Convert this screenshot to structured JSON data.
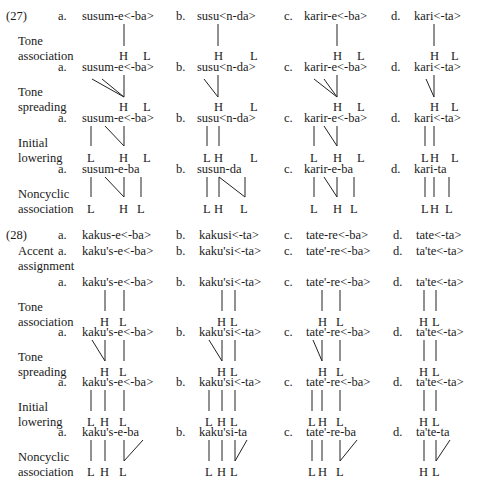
{
  "texts": [
    {
      "id": "ex27",
      "x": 6,
      "y": 9,
      "s": "(27)"
    },
    {
      "id": "r1a",
      "x": 58,
      "y": 9,
      "s": "a."
    },
    {
      "id": "r1aw",
      "x": 82,
      "y": 9,
      "s": "susum-e<-ba>"
    },
    {
      "id": "r1b",
      "x": 176,
      "y": 9,
      "s": "b."
    },
    {
      "id": "r1bw",
      "x": 197,
      "y": 9,
      "s": "susu<n-da>"
    },
    {
      "id": "r1c",
      "x": 284,
      "y": 9,
      "s": "c."
    },
    {
      "id": "r1cw",
      "x": 304,
      "y": 9,
      "s": "karir-e<-ba>"
    },
    {
      "id": "r1d",
      "x": 391,
      "y": 9,
      "s": "d."
    },
    {
      "id": "r1dw",
      "x": 414,
      "y": 9,
      "s": "kari<-ta>"
    },
    {
      "id": "l1a",
      "x": 18,
      "y": 34,
      "s": "Tone"
    },
    {
      "id": "l1b",
      "x": 18,
      "y": 49,
      "s": "association"
    },
    {
      "id": "t1a1",
      "x": 119,
      "y": 49,
      "s": "H"
    },
    {
      "id": "t1a2",
      "x": 143,
      "y": 49,
      "s": "L"
    },
    {
      "id": "t1b1",
      "x": 214,
      "y": 49,
      "s": "H"
    },
    {
      "id": "t1b2",
      "x": 250,
      "y": 49,
      "s": "L"
    },
    {
      "id": "t1c1",
      "x": 333,
      "y": 49,
      "s": "H"
    },
    {
      "id": "t1c2",
      "x": 357,
      "y": 49,
      "s": "L"
    },
    {
      "id": "t1d1",
      "x": 430,
      "y": 49,
      "s": "H"
    },
    {
      "id": "t1d2",
      "x": 451,
      "y": 49,
      "s": "L"
    },
    {
      "id": "r2a",
      "x": 58,
      "y": 60,
      "s": "a."
    },
    {
      "id": "r2aw",
      "x": 82,
      "y": 60,
      "s": "susum-e<-ba>"
    },
    {
      "id": "r2b",
      "x": 176,
      "y": 60,
      "s": "b."
    },
    {
      "id": "r2bw",
      "x": 197,
      "y": 60,
      "s": "susu<n-da>"
    },
    {
      "id": "r2c",
      "x": 284,
      "y": 60,
      "s": "c."
    },
    {
      "id": "r2cw",
      "x": 304,
      "y": 60,
      "s": "karir-e<-ba>"
    },
    {
      "id": "r2d",
      "x": 391,
      "y": 60,
      "s": "d."
    },
    {
      "id": "r2dw",
      "x": 414,
      "y": 60,
      "s": "kari<-ta>"
    },
    {
      "id": "l2a",
      "x": 18,
      "y": 85,
      "s": "Tone"
    },
    {
      "id": "l2b",
      "x": 18,
      "y": 100,
      "s": "spreading"
    },
    {
      "id": "t2a1",
      "x": 119,
      "y": 100,
      "s": "H"
    },
    {
      "id": "t2a2",
      "x": 143,
      "y": 100,
      "s": "L"
    },
    {
      "id": "t2b1",
      "x": 214,
      "y": 100,
      "s": "H"
    },
    {
      "id": "t2b2",
      "x": 250,
      "y": 100,
      "s": "L"
    },
    {
      "id": "t2c1",
      "x": 333,
      "y": 100,
      "s": "H"
    },
    {
      "id": "t2c2",
      "x": 357,
      "y": 100,
      "s": "L"
    },
    {
      "id": "t2d1",
      "x": 430,
      "y": 100,
      "s": "H"
    },
    {
      "id": "t2d2",
      "x": 451,
      "y": 100,
      "s": "L"
    },
    {
      "id": "r3a",
      "x": 58,
      "y": 111,
      "s": "a."
    },
    {
      "id": "r3aw",
      "x": 82,
      "y": 111,
      "s": "susum-e<-ba>"
    },
    {
      "id": "r3b",
      "x": 176,
      "y": 111,
      "s": "b."
    },
    {
      "id": "r3bw",
      "x": 197,
      "y": 111,
      "s": "susu<n-da>"
    },
    {
      "id": "r3c",
      "x": 284,
      "y": 111,
      "s": "c."
    },
    {
      "id": "r3cw",
      "x": 304,
      "y": 111,
      "s": "karir-e<-ba>"
    },
    {
      "id": "r3d",
      "x": 391,
      "y": 111,
      "s": "d."
    },
    {
      "id": "r3dw",
      "x": 414,
      "y": 111,
      "s": "kari<-ta>"
    },
    {
      "id": "l3a",
      "x": 18,
      "y": 136,
      "s": "Initial"
    },
    {
      "id": "l3b",
      "x": 18,
      "y": 151,
      "s": "lowering"
    },
    {
      "id": "t3a1",
      "x": 87,
      "y": 151,
      "s": "L"
    },
    {
      "id": "t3a2",
      "x": 119,
      "y": 151,
      "s": "H"
    },
    {
      "id": "t3a3",
      "x": 143,
      "y": 151,
      "s": "L"
    },
    {
      "id": "t3b1",
      "x": 203,
      "y": 151,
      "s": "L"
    },
    {
      "id": "t3b2",
      "x": 214,
      "y": 151,
      "s": "H"
    },
    {
      "id": "t3b3",
      "x": 250,
      "y": 151,
      "s": "L"
    },
    {
      "id": "t3c1",
      "x": 310,
      "y": 151,
      "s": "L"
    },
    {
      "id": "t3c2",
      "x": 333,
      "y": 151,
      "s": "H"
    },
    {
      "id": "t3c3",
      "x": 357,
      "y": 151,
      "s": "L"
    },
    {
      "id": "t3d1",
      "x": 421,
      "y": 151,
      "s": "L"
    },
    {
      "id": "t3d2",
      "x": 430,
      "y": 151,
      "s": "H"
    },
    {
      "id": "t3d3",
      "x": 451,
      "y": 151,
      "s": "L"
    },
    {
      "id": "r4a",
      "x": 58,
      "y": 162,
      "s": "a."
    },
    {
      "id": "r4aw",
      "x": 82,
      "y": 162,
      "s": "susum-e-ba"
    },
    {
      "id": "r4b",
      "x": 176,
      "y": 162,
      "s": "b."
    },
    {
      "id": "r4bw",
      "x": 197,
      "y": 162,
      "s": "susun-da"
    },
    {
      "id": "r4c",
      "x": 284,
      "y": 162,
      "s": "c."
    },
    {
      "id": "r4cw",
      "x": 304,
      "y": 162,
      "s": "karir-e-ba"
    },
    {
      "id": "r4d",
      "x": 391,
      "y": 162,
      "s": "d."
    },
    {
      "id": "r4dw",
      "x": 414,
      "y": 162,
      "s": "kari-ta"
    },
    {
      "id": "l4a",
      "x": 18,
      "y": 187,
      "s": "Noncyclic"
    },
    {
      "id": "l4b",
      "x": 18,
      "y": 202,
      "s": "association"
    },
    {
      "id": "t4a1",
      "x": 87,
      "y": 202,
      "s": "L"
    },
    {
      "id": "t4a2",
      "x": 119,
      "y": 202,
      "s": "H"
    },
    {
      "id": "t4a3",
      "x": 137,
      "y": 202,
      "s": "L"
    },
    {
      "id": "t4b1",
      "x": 203,
      "y": 202,
      "s": "L"
    },
    {
      "id": "t4b2",
      "x": 214,
      "y": 202,
      "s": "H"
    },
    {
      "id": "t4b3",
      "x": 240,
      "y": 202,
      "s": "L"
    },
    {
      "id": "t4c1",
      "x": 310,
      "y": 202,
      "s": "L"
    },
    {
      "id": "t4c2",
      "x": 333,
      "y": 202,
      "s": "H"
    },
    {
      "id": "t4c3",
      "x": 350,
      "y": 202,
      "s": "L"
    },
    {
      "id": "t4d1",
      "x": 421,
      "y": 202,
      "s": "L"
    },
    {
      "id": "t4d2",
      "x": 430,
      "y": 202,
      "s": "H"
    },
    {
      "id": "t4d3",
      "x": 445,
      "y": 202,
      "s": "L"
    },
    {
      "id": "ex28",
      "x": 6,
      "y": 228,
      "s": "(28)"
    },
    {
      "id": "s1a",
      "x": 58,
      "y": 228,
      "s": "a."
    },
    {
      "id": "s1aw",
      "x": 82,
      "y": 228,
      "s": "kakus-e<-ba>"
    },
    {
      "id": "s1b",
      "x": 176,
      "y": 228,
      "s": "b."
    },
    {
      "id": "s1bw",
      "x": 199,
      "y": 228,
      "s": "kakusi<-ta>"
    },
    {
      "id": "s1c",
      "x": 284,
      "y": 228,
      "s": "c."
    },
    {
      "id": "s1cw",
      "x": 306,
      "y": 228,
      "s": "tate-re<-ba>"
    },
    {
      "id": "s1d",
      "x": 393,
      "y": 228,
      "s": "d."
    },
    {
      "id": "s1dw",
      "x": 416,
      "y": 228,
      "s": "tate<-ta>"
    },
    {
      "id": "acc1",
      "x": 18,
      "y": 244,
      "s": "Accent"
    },
    {
      "id": "s2a",
      "x": 58,
      "y": 244,
      "s": "a."
    },
    {
      "id": "s2aw",
      "x": 82,
      "y": 244,
      "s": "kaku's-e<-ba>"
    },
    {
      "id": "s2b",
      "x": 176,
      "y": 244,
      "s": "b."
    },
    {
      "id": "s2bw",
      "x": 199,
      "y": 244,
      "s": "kaku'si<-ta>"
    },
    {
      "id": "s2c",
      "x": 284,
      "y": 244,
      "s": "c."
    },
    {
      "id": "s2cw",
      "x": 306,
      "y": 244,
      "s": "tate'-re<-ba>"
    },
    {
      "id": "s2d",
      "x": 393,
      "y": 244,
      "s": "d."
    },
    {
      "id": "s2dw",
      "x": 416,
      "y": 244,
      "s": "ta'te<-ta>"
    },
    {
      "id": "acc2",
      "x": 18,
      "y": 259,
      "s": "assignment"
    },
    {
      "id": "s3a",
      "x": 58,
      "y": 275,
      "s": "a."
    },
    {
      "id": "s3aw",
      "x": 82,
      "y": 275,
      "s": "kaku's-e<-ba>"
    },
    {
      "id": "s3b",
      "x": 176,
      "y": 275,
      "s": "b."
    },
    {
      "id": "s3bw",
      "x": 199,
      "y": 275,
      "s": "kaku'si<-ta>"
    },
    {
      "id": "s3c",
      "x": 284,
      "y": 275,
      "s": "c."
    },
    {
      "id": "s3cw",
      "x": 306,
      "y": 275,
      "s": "tate'-re<-ba>"
    },
    {
      "id": "s3d",
      "x": 393,
      "y": 275,
      "s": "d."
    },
    {
      "id": "s3dw",
      "x": 416,
      "y": 275,
      "s": "ta'te<-ta>"
    },
    {
      "id": "m3a",
      "x": 18,
      "y": 300,
      "s": "Tone"
    },
    {
      "id": "m3b",
      "x": 18,
      "y": 315,
      "s": "association"
    },
    {
      "id": "u3a1",
      "x": 100,
      "y": 315,
      "s": "H"
    },
    {
      "id": "u3a2",
      "x": 119,
      "y": 315,
      "s": "L"
    },
    {
      "id": "u3b1",
      "x": 217,
      "y": 315,
      "s": "H"
    },
    {
      "id": "u3b2",
      "x": 230,
      "y": 315,
      "s": "L"
    },
    {
      "id": "u3c1",
      "x": 318,
      "y": 315,
      "s": "H"
    },
    {
      "id": "u3c2",
      "x": 336,
      "y": 315,
      "s": "L"
    },
    {
      "id": "u3d1",
      "x": 419,
      "y": 315,
      "s": "H"
    },
    {
      "id": "u3d2",
      "x": 432,
      "y": 315,
      "s": "L"
    },
    {
      "id": "s4a",
      "x": 58,
      "y": 325,
      "s": "a."
    },
    {
      "id": "s4aw",
      "x": 82,
      "y": 325,
      "s": "kaku's-e<-ba>"
    },
    {
      "id": "s4b",
      "x": 176,
      "y": 325,
      "s": "b."
    },
    {
      "id": "s4bw",
      "x": 199,
      "y": 325,
      "s": "kaku'si<-ta>"
    },
    {
      "id": "s4c",
      "x": 284,
      "y": 325,
      "s": "c."
    },
    {
      "id": "s4cw",
      "x": 306,
      "y": 325,
      "s": "tate'-re<-ba>"
    },
    {
      "id": "s4d",
      "x": 393,
      "y": 325,
      "s": "d."
    },
    {
      "id": "s4dw",
      "x": 416,
      "y": 325,
      "s": "ta'te<-ta>"
    },
    {
      "id": "m4a",
      "x": 18,
      "y": 350,
      "s": "Tone"
    },
    {
      "id": "m4b",
      "x": 18,
      "y": 365,
      "s": "spreading"
    },
    {
      "id": "u4a1",
      "x": 100,
      "y": 365,
      "s": "H"
    },
    {
      "id": "u4a2",
      "x": 119,
      "y": 365,
      "s": "L"
    },
    {
      "id": "u4b1",
      "x": 217,
      "y": 365,
      "s": "H"
    },
    {
      "id": "u4b2",
      "x": 230,
      "y": 365,
      "s": "L"
    },
    {
      "id": "u4c1",
      "x": 318,
      "y": 365,
      "s": "H"
    },
    {
      "id": "u4c2",
      "x": 336,
      "y": 365,
      "s": "L"
    },
    {
      "id": "u4d1",
      "x": 419,
      "y": 365,
      "s": "H"
    },
    {
      "id": "u4d2",
      "x": 432,
      "y": 365,
      "s": "L"
    },
    {
      "id": "s5a",
      "x": 58,
      "y": 375,
      "s": "a."
    },
    {
      "id": "s5aw",
      "x": 82,
      "y": 375,
      "s": "kaku's-e<-ba>"
    },
    {
      "id": "s5b",
      "x": 176,
      "y": 375,
      "s": "b."
    },
    {
      "id": "s5bw",
      "x": 199,
      "y": 375,
      "s": "kaku'si<-ta>"
    },
    {
      "id": "s5c",
      "x": 284,
      "y": 375,
      "s": "c."
    },
    {
      "id": "s5cw",
      "x": 306,
      "y": 375,
      "s": "tate'-re<-ba>"
    },
    {
      "id": "s5d",
      "x": 393,
      "y": 375,
      "s": "d."
    },
    {
      "id": "s5dw",
      "x": 416,
      "y": 375,
      "s": "ta'te<-ta>"
    },
    {
      "id": "m5a",
      "x": 18,
      "y": 400,
      "s": "Initial"
    },
    {
      "id": "m5b",
      "x": 18,
      "y": 415,
      "s": "lowering"
    },
    {
      "id": "u5a1",
      "x": 87,
      "y": 415,
      "s": "L"
    },
    {
      "id": "u5a2",
      "x": 100,
      "y": 415,
      "s": "H"
    },
    {
      "id": "u5a3",
      "x": 119,
      "y": 415,
      "s": "L"
    },
    {
      "id": "u5b1",
      "x": 205,
      "y": 415,
      "s": "L"
    },
    {
      "id": "u5b2",
      "x": 217,
      "y": 415,
      "s": "H"
    },
    {
      "id": "u5b3",
      "x": 230,
      "y": 415,
      "s": "L"
    },
    {
      "id": "u5c1",
      "x": 308,
      "y": 415,
      "s": "L"
    },
    {
      "id": "u5c2",
      "x": 318,
      "y": 415,
      "s": "H"
    },
    {
      "id": "u5c3",
      "x": 336,
      "y": 415,
      "s": "L"
    },
    {
      "id": "u5d1",
      "x": 419,
      "y": 415,
      "s": "H"
    },
    {
      "id": "u5d2",
      "x": 432,
      "y": 415,
      "s": "L"
    },
    {
      "id": "s6a",
      "x": 58,
      "y": 425,
      "s": "a."
    },
    {
      "id": "s6aw",
      "x": 82,
      "y": 425,
      "s": "kaku's-e-ba"
    },
    {
      "id": "s6b",
      "x": 176,
      "y": 425,
      "s": "b."
    },
    {
      "id": "s6bw",
      "x": 199,
      "y": 425,
      "s": "kaku'si-ta"
    },
    {
      "id": "s6c",
      "x": 284,
      "y": 425,
      "s": "c."
    },
    {
      "id": "s6cw",
      "x": 306,
      "y": 425,
      "s": "tate'-re-ba"
    },
    {
      "id": "s6d",
      "x": 393,
      "y": 425,
      "s": "d."
    },
    {
      "id": "s6dw",
      "x": 416,
      "y": 425,
      "s": "ta'te-ta"
    },
    {
      "id": "m6a",
      "x": 18,
      "y": 450,
      "s": "Noncyclic"
    },
    {
      "id": "m6b",
      "x": 18,
      "y": 465,
      "s": "association"
    },
    {
      "id": "u6a1",
      "x": 87,
      "y": 465,
      "s": "L"
    },
    {
      "id": "u6a2",
      "x": 100,
      "y": 465,
      "s": "H"
    },
    {
      "id": "u6a3",
      "x": 119,
      "y": 465,
      "s": "L"
    },
    {
      "id": "u6b1",
      "x": 205,
      "y": 465,
      "s": "L"
    },
    {
      "id": "u6b2",
      "x": 217,
      "y": 465,
      "s": "H"
    },
    {
      "id": "u6b3",
      "x": 230,
      "y": 465,
      "s": "L"
    },
    {
      "id": "u6c1",
      "x": 308,
      "y": 465,
      "s": "L"
    },
    {
      "id": "u6c2",
      "x": 318,
      "y": 465,
      "s": "H"
    },
    {
      "id": "u6c3",
      "x": 336,
      "y": 465,
      "s": "L"
    },
    {
      "id": "u6d1",
      "x": 419,
      "y": 465,
      "s": "H"
    },
    {
      "id": "u6d2",
      "x": 432,
      "y": 465,
      "s": "L"
    }
  ],
  "lines": [
    [
      124,
      24,
      124,
      46
    ],
    [
      218,
      24,
      218,
      46
    ],
    [
      337,
      24,
      337,
      46
    ],
    [
      434,
      24,
      434,
      46
    ],
    [
      124,
      75,
      124,
      97
    ],
    [
      92,
      79,
      124,
      97
    ],
    [
      102,
      79,
      124,
      97
    ],
    [
      218,
      75,
      218,
      97
    ],
    [
      204,
      79,
      218,
      97
    ],
    [
      337,
      75,
      337,
      97
    ],
    [
      314,
      79,
      337,
      97
    ],
    [
      324,
      79,
      337,
      97
    ],
    [
      434,
      75,
      434,
      97
    ],
    [
      426,
      79,
      434,
      97
    ],
    [
      91,
      126,
      91,
      146
    ],
    [
      124,
      126,
      124,
      146
    ],
    [
      105,
      126,
      124,
      146
    ],
    [
      207,
      126,
      207,
      146
    ],
    [
      219,
      126,
      219,
      146
    ],
    [
      314,
      126,
      314,
      146
    ],
    [
      337,
      126,
      337,
      146
    ],
    [
      324,
      126,
      337,
      146
    ],
    [
      425,
      126,
      425,
      146
    ],
    [
      434,
      126,
      434,
      146
    ],
    [
      91,
      177,
      91,
      197
    ],
    [
      124,
      177,
      124,
      197
    ],
    [
      105,
      177,
      124,
      197
    ],
    [
      141,
      177,
      141,
      197
    ],
    [
      207,
      177,
      207,
      197
    ],
    [
      219,
      177,
      219,
      197
    ],
    [
      219,
      177,
      245,
      197
    ],
    [
      245,
      177,
      245,
      197
    ],
    [
      314,
      177,
      314,
      197
    ],
    [
      337,
      177,
      337,
      197
    ],
    [
      324,
      177,
      337,
      197
    ],
    [
      354,
      177,
      354,
      197
    ],
    [
      425,
      177,
      425,
      197
    ],
    [
      434,
      177,
      434,
      197
    ],
    [
      449,
      177,
      449,
      197
    ],
    [
      105,
      290,
      105,
      311
    ],
    [
      124,
      290,
      124,
      311
    ],
    [
      222,
      290,
      222,
      311
    ],
    [
      235,
      290,
      235,
      311
    ],
    [
      322,
      290,
      322,
      311
    ],
    [
      340,
      290,
      340,
      311
    ],
    [
      424,
      290,
      424,
      311
    ],
    [
      436,
      290,
      436,
      311
    ],
    [
      105,
      340,
      105,
      361
    ],
    [
      92,
      340,
      105,
      361
    ],
    [
      124,
      340,
      124,
      361
    ],
    [
      222,
      340,
      222,
      361
    ],
    [
      209,
      340,
      222,
      361
    ],
    [
      235,
      340,
      235,
      361
    ],
    [
      322,
      340,
      322,
      361
    ],
    [
      313,
      340,
      322,
      361
    ],
    [
      340,
      340,
      340,
      361
    ],
    [
      424,
      340,
      424,
      361
    ],
    [
      436,
      340,
      436,
      361
    ],
    [
      91,
      390,
      91,
      411
    ],
    [
      105,
      390,
      105,
      411
    ],
    [
      124,
      390,
      124,
      411
    ],
    [
      209,
      390,
      209,
      411
    ],
    [
      222,
      390,
      222,
      411
    ],
    [
      235,
      390,
      235,
      411
    ],
    [
      312,
      390,
      312,
      411
    ],
    [
      322,
      390,
      322,
      411
    ],
    [
      340,
      390,
      340,
      411
    ],
    [
      424,
      390,
      424,
      411
    ],
    [
      436,
      390,
      436,
      411
    ],
    [
      91,
      440,
      91,
      461
    ],
    [
      105,
      440,
      105,
      461
    ],
    [
      124,
      440,
      124,
      461
    ],
    [
      124,
      461,
      143,
      440
    ],
    [
      209,
      440,
      209,
      461
    ],
    [
      222,
      440,
      222,
      461
    ],
    [
      235,
      440,
      235,
      461
    ],
    [
      235,
      461,
      247,
      440
    ],
    [
      312,
      440,
      312,
      461
    ],
    [
      322,
      440,
      322,
      461
    ],
    [
      340,
      440,
      340,
      461
    ],
    [
      340,
      461,
      357,
      440
    ],
    [
      424,
      440,
      424,
      461
    ],
    [
      436,
      440,
      436,
      461
    ],
    [
      436,
      461,
      450,
      440
    ]
  ]
}
